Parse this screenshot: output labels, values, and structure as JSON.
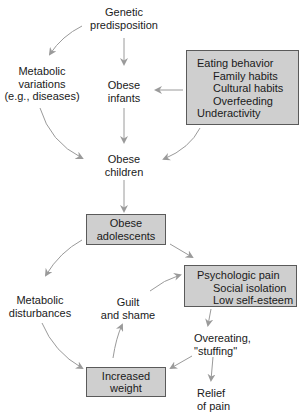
{
  "diagram": {
    "type": "flowchart",
    "colors": {
      "box_fill": "#cfcfcf",
      "box_border": "#5a5a5a",
      "arrow": "#9a9a9a",
      "text": "#1a1a1a"
    },
    "nodes": {
      "genetic": {
        "lines": [
          "Genetic",
          "predisposition"
        ],
        "boxed": false
      },
      "metabolic_variations": {
        "lines": [
          "Metabolic",
          "variations",
          "(e.g., diseases)"
        ],
        "boxed": false
      },
      "obese_infants": {
        "lines": [
          "Obese",
          "infants"
        ],
        "boxed": false
      },
      "eating_behavior": {
        "boxed": true,
        "title": "Eating behavior",
        "subitems": [
          "Family habits",
          "Cultural habits",
          "Overfeeding"
        ],
        "last": "Underactivity"
      },
      "obese_children": {
        "lines": [
          "Obese",
          "children"
        ],
        "boxed": false
      },
      "obese_adolescents": {
        "lines": [
          "Obese",
          "adolescents"
        ],
        "boxed": true
      },
      "metabolic_disturbances": {
        "lines": [
          "Metabolic",
          "disturbances"
        ],
        "boxed": false
      },
      "guilt_shame": {
        "lines": [
          "Guilt",
          "and shame"
        ],
        "boxed": false
      },
      "psychologic_pain": {
        "boxed": true,
        "title": "Psychologic pain",
        "subitems": [
          "Social isolation",
          "Low self-esteem"
        ]
      },
      "overeating": {
        "lines": [
          "Overeating,",
          "\"stuffing\""
        ],
        "boxed": false
      },
      "increased_weight": {
        "lines": [
          "Increased",
          "weight"
        ],
        "boxed": true
      },
      "relief": {
        "lines": [
          "Relief",
          "of pain"
        ],
        "boxed": false
      }
    },
    "edges": [
      {
        "from": "genetic",
        "to": "metabolic_variations"
      },
      {
        "from": "genetic",
        "to": "obese_infants"
      },
      {
        "from": "eating_behavior",
        "to": "obese_infants"
      },
      {
        "from": "obese_infants",
        "to": "obese_children"
      },
      {
        "from": "metabolic_variations",
        "to": "obese_children"
      },
      {
        "from": "eating_behavior",
        "to": "obese_children"
      },
      {
        "from": "obese_children",
        "to": "obese_adolescents"
      },
      {
        "from": "obese_adolescents",
        "to": "metabolic_disturbances"
      },
      {
        "from": "obese_adolescents",
        "to": "psychologic_pain"
      },
      {
        "from": "metabolic_disturbances",
        "to": "increased_weight"
      },
      {
        "from": "increased_weight",
        "to": "guilt_shame"
      },
      {
        "from": "guilt_shame",
        "to": "psychologic_pain"
      },
      {
        "from": "psychologic_pain",
        "to": "overeating"
      },
      {
        "from": "overeating",
        "to": "increased_weight"
      },
      {
        "from": "overeating",
        "to": "relief"
      }
    ]
  }
}
